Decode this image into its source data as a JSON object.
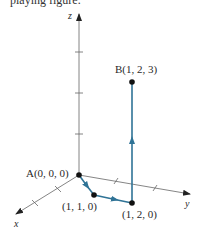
{
  "caption_fragment": "playing figure.",
  "figure": {
    "type": "3D coordinate axes with path",
    "axes": {
      "x": {
        "label": "x"
      },
      "y": {
        "label": "y"
      },
      "z": {
        "label": "z"
      }
    },
    "points": [
      {
        "name": "A",
        "label": "A(0, 0, 0)",
        "coords": [
          0,
          0,
          0
        ]
      },
      {
        "name": "P1",
        "label": "(1, 1, 0)",
        "coords": [
          1,
          1,
          0
        ]
      },
      {
        "name": "P2",
        "label": "(1, 2, 0)",
        "coords": [
          1,
          2,
          0
        ]
      },
      {
        "name": "B",
        "label": "B(1, 2, 3)",
        "coords": [
          1,
          2,
          3
        ]
      }
    ],
    "path": [
      "A",
      "P1",
      "P2",
      "B"
    ],
    "colors": {
      "axis": "#555555",
      "path": "#2f7396",
      "point": "#111111"
    }
  }
}
